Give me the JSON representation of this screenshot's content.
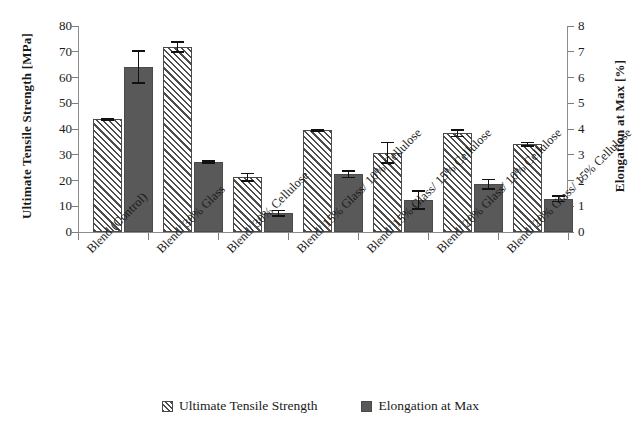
{
  "chart_data": {
    "type": "bar",
    "title": "",
    "xlabel": "",
    "ylabel": "Ultimate Tensile Strength [MPa]",
    "y2label": "Elongation at Max [%]",
    "ylim": [
      0,
      80
    ],
    "y2lim": [
      0,
      8
    ],
    "yticks": [
      0,
      10,
      20,
      30,
      40,
      50,
      60,
      70,
      80
    ],
    "y2ticks": [
      0,
      1,
      2,
      3,
      4,
      5,
      6,
      7,
      8
    ],
    "grid": false,
    "legend_position": "bottom",
    "categories": [
      "Blend (Control)",
      "Blend/ 30% Glass",
      "Blend/ 30% Cellulose",
      "Blend/ 15% Glass/ 10% Cellulose",
      "Blend/ 15% Glass/ 15% Cellulose",
      "Blend/ 20% Glass/ 10% Cellulose",
      "Blend/ 20% Glass/ 15% Cellulose"
    ],
    "series": [
      {
        "name": "Ultimate Tensile Strength",
        "axis": "left",
        "unit": "MPa",
        "color": "#4d4d4d",
        "fill": "diagonal-hatch",
        "values": [
          43.7,
          71.8,
          21.3,
          39.5,
          30.8,
          38.4,
          34.1
        ],
        "errors": [
          0.6,
          2.2,
          1.8,
          0.6,
          4.3,
          1.6,
          1.0
        ]
      },
      {
        "name": "Elongation at Max",
        "axis": "right",
        "unit": "%",
        "color": "#595959",
        "fill": "solid",
        "values": [
          6.4,
          2.72,
          0.73,
          2.25,
          1.25,
          1.85,
          1.29
        ],
        "errors": [
          0.65,
          0.07,
          0.13,
          0.16,
          0.38,
          0.22,
          0.13
        ]
      }
    ]
  },
  "legend": {
    "items": [
      {
        "label": "Ultimate Tensile Strength",
        "swatch": "hatched-swatch"
      },
      {
        "label": "Elongation at Max",
        "swatch": "solid-gray-swatch"
      }
    ]
  },
  "axes": {
    "left_title": "Ultimate Tensile Strength [MPa]",
    "right_title": "Elongation at Max [%]"
  }
}
